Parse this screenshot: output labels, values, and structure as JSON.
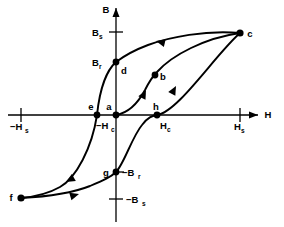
{
  "figure": {
    "background_color": "#ffffff",
    "ink_color": "#000000"
  },
  "axes": {
    "x": {
      "label": "H",
      "label_x": 268,
      "label_y": 118,
      "line_y": 115,
      "line_x1": 8,
      "line_x2": 258,
      "ticks": [
        {
          "name": "neg-hs",
          "base": "−H",
          "sub": "s",
          "x": 21,
          "label_x": 10,
          "label_y": 130
        },
        {
          "name": "pos-hs",
          "base": "H",
          "sub": "s",
          "x": 240,
          "label_x": 234,
          "label_y": 130
        }
      ]
    },
    "y": {
      "label": "B",
      "label_x": 106,
      "label_y": 13,
      "line_x": 116,
      "line_y1": 222,
      "line_y2": 8,
      "ticks": [
        {
          "name": "bs",
          "base": "B",
          "sub": "s",
          "y": 32,
          "label_x": 92,
          "label_y": 36
        },
        {
          "name": "br",
          "base": "B",
          "sub": "r",
          "y": 62,
          "label_x": 92,
          "label_y": 66
        },
        {
          "name": "neg-br",
          "base": "−B",
          "sub": "r",
          "y": 172,
          "label_x": 122,
          "label_y": 176
        },
        {
          "name": "neg-bs",
          "base": "−B",
          "sub": "s",
          "y": 199,
          "label_x": 122,
          "label_y": 203
        }
      ]
    }
  },
  "inline_labels": [
    {
      "name": "neg-hc",
      "base": "−H",
      "sub": "c",
      "x": 96,
      "y": 129
    },
    {
      "name": "pos-hc",
      "base": "H",
      "sub": "c",
      "x": 160,
      "y": 129
    }
  ],
  "points": [
    {
      "id": "a",
      "label": "a",
      "x": 116,
      "y": 115,
      "label_x": 109,
      "label_y": 110,
      "desc": "origin, demagnetized state"
    },
    {
      "id": "b",
      "label": "b",
      "x": 155,
      "y": 75,
      "label_x": 161,
      "label_y": 80,
      "desc": "knee of initial magnetization curve"
    },
    {
      "id": "c",
      "label": "c",
      "x": 240,
      "y": 33,
      "label_x": 248,
      "label_y": 37,
      "desc": "positive saturation"
    },
    {
      "id": "d",
      "label": "d",
      "x": 116,
      "y": 62,
      "label_x": 122,
      "label_y": 72,
      "desc": "positive remanence Br"
    },
    {
      "id": "e",
      "label": "e",
      "x": 97,
      "y": 115,
      "label_x": 88,
      "label_y": 110,
      "desc": "negative coercivity -Hc"
    },
    {
      "id": "f",
      "label": "f",
      "x": 21,
      "y": 198,
      "label_x": 10,
      "label_y": 200,
      "desc": "negative saturation"
    },
    {
      "id": "g",
      "label": "g",
      "x": 116,
      "y": 172,
      "label_x": 105,
      "label_y": 175,
      "desc": "negative remanence -Br"
    },
    {
      "id": "h",
      "label": "h",
      "x": 157,
      "y": 115,
      "label_x": 153,
      "label_y": 110,
      "desc": "positive coercivity Hc"
    }
  ],
  "curves": [
    {
      "name": "initial-magnetization-curve",
      "segment": "a-b-c",
      "path": "M116,115 C128,113 138,103 145,90 C150,80 153,76 157,72 C172,55 205,38 240,33"
    },
    {
      "name": "descending-branch",
      "segment": "c-d-e-f",
      "path": "M240,33 C205,30 170,37 148,45 C132,51 124,56 116,62 C108,69 100,86 97,115 C92,148 76,178 60,187 C46,195 32,197 21,198"
    },
    {
      "name": "ascending-branch",
      "segment": "f-g-h-c",
      "path": "M21,198 C40,197 70,194 90,186 C104,180 111,177 116,172 C124,164 132,137 142,125 C148,117 152,116 157,115 C178,112 215,55 240,33"
    }
  ],
  "flow_arrows": [
    {
      "name": "arrow-initial-curve",
      "x": 146,
      "y": 90,
      "angle": -63,
      "on": "a-b-c"
    },
    {
      "name": "arrow-descending-top",
      "x": 156,
      "y": 41,
      "angle": 193,
      "on": "c-d-e-f"
    },
    {
      "name": "arrow-descending-lower",
      "x": 66,
      "y": 182,
      "angle": 150,
      "on": "c-d-e-f"
    },
    {
      "name": "arrow-ascending-bottom",
      "x": 79,
      "y": 194,
      "angle": -16,
      "on": "f-g-h-c"
    },
    {
      "name": "arrow-ascending-right",
      "x": 176,
      "y": 86,
      "angle": -62,
      "on": "f-g-h-c"
    }
  ]
}
